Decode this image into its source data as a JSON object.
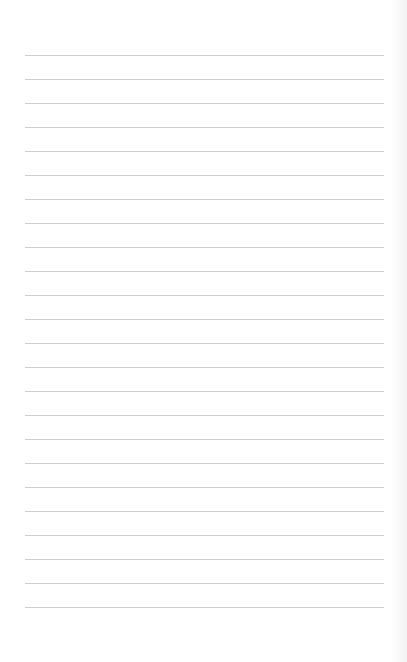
{
  "page": {
    "type": "lined-paper",
    "line_count": 24,
    "first_line_y": 55,
    "line_spacing": 24,
    "line_left": 25,
    "line_right": 384,
    "line_color": "#cfcfcf",
    "background_color": "#ffffff"
  }
}
